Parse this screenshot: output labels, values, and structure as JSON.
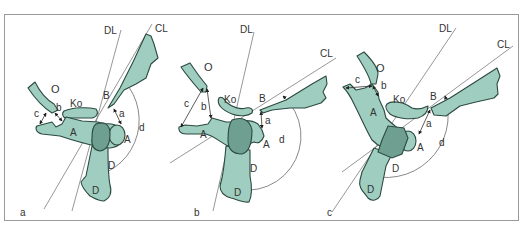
{
  "figure": {
    "colors": {
      "bone_fill": "#9fcdbf",
      "overlap_fill": "#6f9f90",
      "outline": "#2b4a40",
      "reference_lines": "#6a6a6a",
      "frame": "#9a9a9a"
    },
    "panels": [
      {
        "id": "a",
        "panel_label": "a",
        "line_labels": {
          "dl": "DL",
          "cl": "CL"
        },
        "bone_labels": {
          "o": "O",
          "ko": "Ko",
          "b": "B",
          "a1": "A",
          "a2": "A",
          "d1": "D",
          "d2": "D"
        },
        "measure_labels": {
          "a": "a",
          "b": "b",
          "c": "c",
          "d": "d"
        }
      },
      {
        "id": "b",
        "panel_label": "b",
        "line_labels": {
          "dl": "DL",
          "cl": "CL"
        },
        "bone_labels": {
          "o": "O",
          "ko": "Ko",
          "b": "B",
          "a1": "A",
          "a2": "A",
          "d1": "D",
          "d2": "D"
        },
        "measure_labels": {
          "a": "a",
          "b": "b",
          "c": "c",
          "d": "d"
        }
      },
      {
        "id": "c",
        "panel_label": "c",
        "line_labels": {
          "dl": "DL",
          "cl": "CL"
        },
        "bone_labels": {
          "o": "O",
          "ko": "Ko",
          "b": "B",
          "a1": "A",
          "a2": "A",
          "d1": "D",
          "d2": "D"
        },
        "measure_labels": {
          "a": "a",
          "b": "b",
          "c": "c",
          "d": "d"
        }
      }
    ]
  }
}
